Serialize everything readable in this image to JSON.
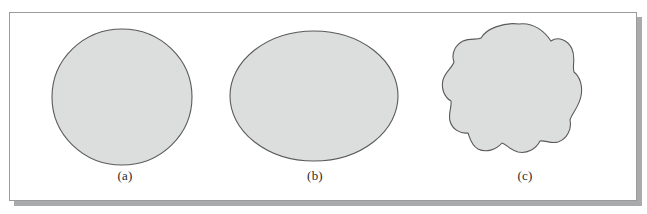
{
  "figure": {
    "kind": "shape-comparison-figure",
    "panel": {
      "background_color": "#ffffff",
      "border_color": "#9a9b9d",
      "shadow_color": "#a9aaac"
    },
    "shape_style": {
      "fill_color": "#dcdddd",
      "stroke_color": "#5a5a5c",
      "stroke_width": 1.1
    },
    "shapes": [
      {
        "id": "shape-a",
        "type": "circle",
        "label": "(a)",
        "center_x": 122,
        "center_y": 97,
        "radius_x": 70,
        "radius_y": 68
      },
      {
        "id": "shape-b",
        "type": "ellipse",
        "label": "(b)",
        "center_x": 314,
        "center_y": 96,
        "radius_x": 84,
        "radius_y": 65
      },
      {
        "id": "shape-c",
        "type": "irregular-blob",
        "label": "(c)",
        "center_x": 519,
        "center_y": 96,
        "radius_x": 63,
        "radius_y": 72,
        "path": "M 519 24 C 534 22 545 32 551 41 C 558 36 568 40 572 49 C 576 58 572 66 574 72 C 580 77 583 86 581 96 C 579 107 572 113 570 120 C 572 129 567 139 558 142 C 551 144 545 140 540 141 C 536 149 527 154 518 152 C 510 150 506 144 502 143 C 496 150 486 153 478 149 C 471 145 470 138 468 133 C 460 134 452 129 450 121 C 448 113 452 107 451 101 C 444 97 441 88 443 80 C 445 72 452 68 454 62 C 451 54 455 45 463 41 C 470 38 477 40 481 38 C 486 29 503 22 519 24 Z"
      }
    ]
  }
}
